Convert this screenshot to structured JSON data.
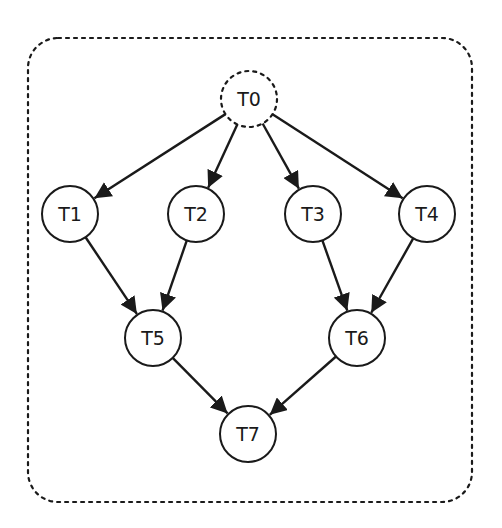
{
  "diagram": {
    "type": "task-dependency-graph",
    "container": {
      "style": "dotted-rounded-rect",
      "x": 28,
      "y": 38,
      "width": 444,
      "height": 464,
      "rx": 30
    },
    "nodes": [
      {
        "id": "T0",
        "label": "T0",
        "x": 249,
        "y": 99,
        "style": "dashed"
      },
      {
        "id": "T1",
        "label": "T1",
        "x": 70,
        "y": 214,
        "style": "solid"
      },
      {
        "id": "T2",
        "label": "T2",
        "x": 196,
        "y": 214,
        "style": "solid"
      },
      {
        "id": "T3",
        "label": "T3",
        "x": 313,
        "y": 214,
        "style": "solid"
      },
      {
        "id": "T4",
        "label": "T4",
        "x": 427,
        "y": 214,
        "style": "solid"
      },
      {
        "id": "T5",
        "label": "T5",
        "x": 153,
        "y": 338,
        "style": "solid"
      },
      {
        "id": "T6",
        "label": "T6",
        "x": 357,
        "y": 338,
        "style": "solid"
      },
      {
        "id": "T7",
        "label": "T7",
        "x": 248,
        "y": 434,
        "style": "solid"
      }
    ],
    "edges": [
      {
        "from": "T0",
        "to": "T1"
      },
      {
        "from": "T0",
        "to": "T2"
      },
      {
        "from": "T0",
        "to": "T3"
      },
      {
        "from": "T0",
        "to": "T4"
      },
      {
        "from": "T1",
        "to": "T5"
      },
      {
        "from": "T2",
        "to": "T5"
      },
      {
        "from": "T3",
        "to": "T6"
      },
      {
        "from": "T4",
        "to": "T6"
      },
      {
        "from": "T5",
        "to": "T7"
      },
      {
        "from": "T6",
        "to": "T7"
      }
    ],
    "node_radius": 28,
    "colors": {
      "stroke": "#1a1a1a",
      "fill": "#ffffff",
      "background": "#ffffff"
    }
  }
}
